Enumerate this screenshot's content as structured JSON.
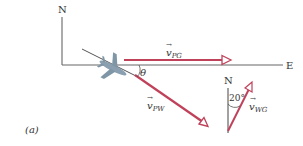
{
  "figure": {
    "panel_label": "(a)",
    "axes": {
      "north_label": "N",
      "east_label": "E"
    },
    "vectors": {
      "v_PG": {
        "symbol": "v",
        "subscript": "PG"
      },
      "v_PW": {
        "symbol": "v",
        "subscript": "PW"
      },
      "v_WG": {
        "symbol": "v",
        "subscript": "WG"
      }
    },
    "angle_theta": "θ",
    "wind_diagram": {
      "north_label": "N",
      "angle_label": "20°"
    },
    "colors": {
      "vector": "#c0415a",
      "axis": "#555555",
      "plane": "#8aa0b0"
    }
  }
}
